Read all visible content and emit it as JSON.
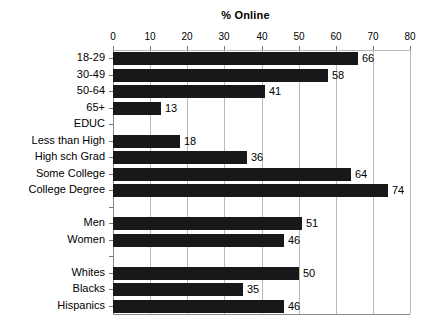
{
  "chart_data": {
    "type": "bar",
    "orientation": "horizontal",
    "title": "% Online",
    "xlabel": "",
    "ylabel": "",
    "xlim": [
      0,
      80
    ],
    "xticks": [
      0,
      10,
      20,
      30,
      40,
      50,
      60,
      70,
      80
    ],
    "grid": true,
    "legend": "none",
    "bar_color": "#181818",
    "categories": [
      "18-29",
      "30-49",
      "50-64",
      "65+",
      "EDUC",
      "Less than High",
      "High sch Grad",
      "Some College",
      "College Degree",
      "",
      "Men",
      "Women",
      "",
      "Whites",
      "Blacks",
      "Hispanics"
    ],
    "values": [
      66,
      58,
      41,
      13,
      null,
      18,
      36,
      64,
      74,
      null,
      51,
      46,
      null,
      50,
      35,
      46
    ],
    "data_labels": [
      "66",
      "58",
      "41",
      "13",
      "",
      "18",
      "36",
      "64",
      "74",
      "",
      "51",
      "46",
      "",
      "50",
      "35",
      "46"
    ]
  }
}
